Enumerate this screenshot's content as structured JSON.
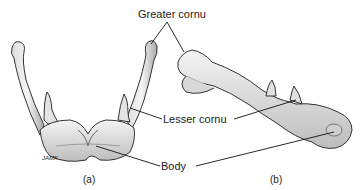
{
  "figure": {
    "labels": {
      "greater_cornu": "Greater cornu",
      "lesser_cornu": "Lesser cornu",
      "body": "Body"
    },
    "panels": {
      "a": "(a)",
      "b": "(b)"
    },
    "signature": "JAMK"
  }
}
